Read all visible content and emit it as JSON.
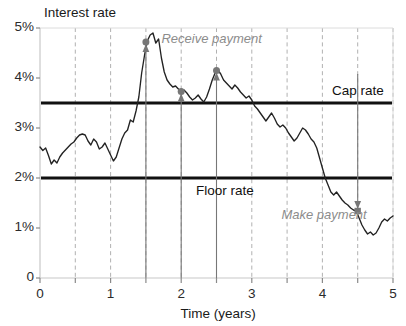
{
  "chart_data": {
    "type": "line",
    "title": "",
    "xlabel": "Time (years)",
    "ylabel": "Interest rate",
    "xlim": [
      0,
      5
    ],
    "ylim": [
      0,
      5
    ],
    "grid": true,
    "grid_style": "dashed-vertical",
    "legend": "none",
    "xticks": [
      0,
      1,
      2,
      3,
      4,
      5
    ],
    "xticklabels": [
      "0",
      "1",
      "2",
      "3",
      "4",
      "5"
    ],
    "xminorticks": [
      0.5,
      1.5,
      2.5,
      3.5,
      4.5
    ],
    "yticks": [
      0,
      1,
      2,
      3,
      4,
      5
    ],
    "yticklabels": [
      "0",
      "1%",
      "2%",
      "3%",
      "4%",
      "5%"
    ],
    "series": [
      {
        "name": "Interest rate",
        "color": "#222222",
        "x": [
          0.0,
          0.04,
          0.08,
          0.12,
          0.16,
          0.2,
          0.24,
          0.28,
          0.32,
          0.36,
          0.4,
          0.44,
          0.48,
          0.52,
          0.56,
          0.6,
          0.64,
          0.68,
          0.72,
          0.76,
          0.8,
          0.84,
          0.88,
          0.92,
          0.96,
          1.0,
          1.04,
          1.08,
          1.12,
          1.16,
          1.2,
          1.24,
          1.28,
          1.32,
          1.36,
          1.4,
          1.44,
          1.48,
          1.52,
          1.56,
          1.6,
          1.64,
          1.68,
          1.72,
          1.76,
          1.8,
          1.84,
          1.88,
          1.92,
          1.96,
          2.0,
          2.04,
          2.08,
          2.12,
          2.16,
          2.2,
          2.24,
          2.28,
          2.32,
          2.36,
          2.4,
          2.44,
          2.48,
          2.52,
          2.56,
          2.6,
          2.64,
          2.68,
          2.72,
          2.76,
          2.8,
          2.84,
          2.88,
          2.92,
          2.96,
          3.0,
          3.04,
          3.08,
          3.12,
          3.16,
          3.2,
          3.24,
          3.28,
          3.32,
          3.36,
          3.4,
          3.44,
          3.48,
          3.52,
          3.56,
          3.6,
          3.64,
          3.68,
          3.72,
          3.76,
          3.8,
          3.84,
          3.88,
          3.92,
          3.96,
          4.0,
          4.04,
          4.08,
          4.12,
          4.16,
          4.2,
          4.24,
          4.28,
          4.32,
          4.36,
          4.4,
          4.44,
          4.48,
          4.52,
          4.56,
          4.6,
          4.64,
          4.68,
          4.72,
          4.76,
          4.8,
          4.84,
          4.88,
          4.92,
          4.96,
          5.0
        ],
        "y": [
          2.62,
          2.55,
          2.6,
          2.45,
          2.28,
          2.36,
          2.3,
          2.42,
          2.5,
          2.56,
          2.62,
          2.68,
          2.72,
          2.8,
          2.86,
          2.88,
          2.86,
          2.74,
          2.66,
          2.78,
          2.72,
          2.58,
          2.62,
          2.7,
          2.58,
          2.46,
          2.34,
          2.42,
          2.6,
          2.78,
          2.9,
          2.96,
          3.16,
          3.12,
          3.34,
          3.62,
          4.1,
          4.45,
          4.74,
          4.86,
          4.9,
          4.7,
          4.78,
          4.4,
          4.12,
          3.96,
          3.88,
          3.82,
          3.84,
          3.78,
          3.72,
          3.76,
          3.7,
          3.62,
          3.56,
          3.6,
          3.66,
          3.58,
          3.52,
          3.62,
          3.78,
          3.96,
          4.1,
          4.16,
          4.08,
          3.96,
          3.9,
          3.84,
          3.78,
          3.86,
          3.8,
          3.72,
          3.66,
          3.6,
          3.64,
          3.56,
          3.44,
          3.38,
          3.3,
          3.22,
          3.14,
          3.22,
          3.3,
          3.2,
          3.08,
          3.02,
          3.06,
          3.0,
          2.9,
          2.82,
          2.74,
          2.8,
          2.9,
          3.0,
          2.96,
          2.88,
          2.78,
          2.72,
          2.6,
          2.4,
          2.2,
          2.0,
          1.86,
          1.72,
          1.66,
          1.72,
          1.64,
          1.56,
          1.5,
          1.46,
          1.4,
          1.36,
          1.34,
          1.2,
          1.06,
          0.96,
          0.88,
          0.92,
          0.86,
          0.9,
          1.0,
          1.12,
          1.18,
          1.14,
          1.2,
          1.24
        ]
      }
    ],
    "reference_lines": [
      {
        "name": "Cap rate",
        "value": 3.5,
        "label": "Cap rate",
        "color": "#111111",
        "width": 3
      },
      {
        "name": "Floor rate",
        "value": 2.0,
        "label": "Floor rate",
        "color": "#111111",
        "width": 3
      }
    ],
    "annotations": [
      {
        "name": "receive-payment",
        "text": "Receive payment",
        "color": "#8c8c8c",
        "style": "italic",
        "x": 1.72,
        "y": 4.74
      },
      {
        "name": "make-payment",
        "text": "Make payment",
        "color": "#8c8c8c",
        "style": "italic",
        "x": 3.42,
        "y": 1.22
      }
    ],
    "markers": [
      {
        "name": "receive-marker-1",
        "x": 1.5,
        "y": 4.72,
        "direction": "up",
        "color": "#777777"
      },
      {
        "name": "receive-marker-2",
        "x": 2.0,
        "y": 3.73,
        "direction": "up",
        "color": "#777777"
      },
      {
        "name": "receive-marker-3",
        "x": 2.5,
        "y": 4.15,
        "direction": "up",
        "color": "#777777"
      },
      {
        "name": "make-marker-1",
        "x": 4.5,
        "y": 1.34,
        "direction": "down",
        "color": "#777777"
      }
    ]
  },
  "axes": {
    "y_title": "Interest rate",
    "x_title": "Time (years)"
  },
  "colors": {
    "series": "#222222",
    "reference": "#111111",
    "marker": "#777777",
    "annotation": "#8c8c8c",
    "grid": "#9a9a9a",
    "axis": "#c8c8c8"
  }
}
